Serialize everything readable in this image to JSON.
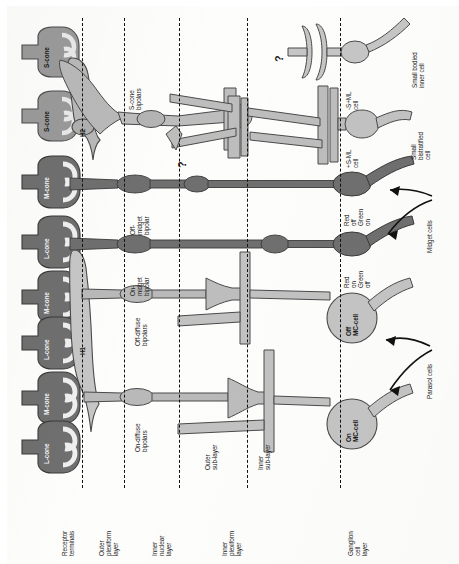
{
  "figure": {
    "orientation": "rotated-90",
    "colors": {
      "cone_dark": "#6f6f6f",
      "cone_mid": "#8d8d8d",
      "cell_light": "#b9b9b9",
      "cell_lighter": "#cfcfcf",
      "outline": "#4a4a4a",
      "dash": "#111111",
      "text": "#1b1b1b"
    }
  },
  "layer_labels": [
    {
      "id": "receptor-terminals",
      "text": "Receptor\nterminals"
    },
    {
      "id": "outer-plexiform-layer",
      "text": "Outer\nplexiform\nlayer"
    },
    {
      "id": "inner-nuclear-layer",
      "text": "Inner\nnuclear\nlayer"
    },
    {
      "id": "inner-plexiform-layer",
      "text": "Inner\nplexiform\nlayer"
    },
    {
      "id": "ganglion-cell-layer",
      "text": "Ganglion\ncell\nlayer"
    }
  ],
  "sublayer_labels": [
    {
      "id": "outer-sub-layer",
      "text": "Outer\nsub-layer"
    },
    {
      "id": "inner-sub-layer",
      "text": "Inner\nsub-layer"
    }
  ],
  "photoreceptors": [
    {
      "id": "cone-1",
      "label": "S-cone",
      "type": "S"
    },
    {
      "id": "cone-2",
      "label": "S-cone",
      "type": "S"
    },
    {
      "id": "cone-3",
      "label": "M-cone",
      "type": "M"
    },
    {
      "id": "cone-4",
      "label": "L-cone",
      "type": "L"
    },
    {
      "id": "cone-5",
      "label": "M-cone",
      "type": "M"
    },
    {
      "id": "cone-6",
      "label": "L-cone",
      "type": "L"
    },
    {
      "id": "cone-7",
      "label": "M-cone",
      "type": "M"
    },
    {
      "id": "cone-8",
      "label": "L-cone",
      "type": "L"
    }
  ],
  "horizontal_cells": [
    {
      "id": "h2",
      "label": "H2"
    },
    {
      "id": "h1",
      "label": "H1"
    }
  ],
  "bipolar_cells": [
    {
      "id": "s-cone-bipolars",
      "label": "S-cone\nbipolars"
    },
    {
      "id": "off-midget-bipolar",
      "label": "Off-\nmidget\nbipolar"
    },
    {
      "id": "on-midget-bipolar",
      "label": "On-\nmidget\nbipolar"
    },
    {
      "id": "off-diffuse-bipolars",
      "label": "Off-diffuse\nbipolars"
    },
    {
      "id": "on-diffuse-bipolars",
      "label": "On-diffuse\nbipolars"
    }
  ],
  "ganglion_cells": [
    {
      "id": "small-bodied-inner-cell",
      "label": "Small bodied\ninner cell"
    },
    {
      "id": "minus-s-plus-ml-cell",
      "label": "-S+ML\ncell"
    },
    {
      "id": "plus-s-minus-ml-cell",
      "label": "+S-ML\ncell"
    },
    {
      "id": "small-bistratified-cell",
      "label": "Small\nbistratified\ncell"
    },
    {
      "id": "red-off-green-on",
      "label": "Red\noff\nGreen\non"
    },
    {
      "id": "red-on-green-off",
      "label": "Red\non\nGreen\noff"
    },
    {
      "id": "midget-cells",
      "label": "Midget cells"
    },
    {
      "id": "off-mc-cell",
      "label": "Off\nMC-cell"
    },
    {
      "id": "on-mc-cell",
      "label": "On\nMC-cell"
    },
    {
      "id": "parasol-cells",
      "label": "Parasol cells"
    }
  ],
  "annotations": [
    {
      "id": "question-mark-upper",
      "text": "?"
    },
    {
      "id": "question-mark-lower",
      "text": "?"
    }
  ]
}
